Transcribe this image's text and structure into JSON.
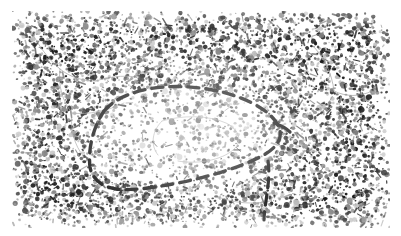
{
  "figure": {
    "domain": "natural-image",
    "kind": "histology-micrograph",
    "staining_appearance": "monochrome speckled nuclei on pale background",
    "orientation": "landscape",
    "plate": {
      "left": 12,
      "top": 11,
      "width": 378,
      "height": 217,
      "background_color": "#ffffff",
      "speckle_color": "#1a1a1a",
      "midtone_color": "#7a7a7a",
      "faint_color": "#b9b9b9"
    }
  },
  "cropped_header": {
    "visible": true,
    "note": "bottom few pixels of a text line cropped off above the figure",
    "ghost_text": "a p p e a r a n c e   o f   t h e   l e s i o n a l   t i s s u e   b o u n d a r y",
    "color": "#e2e2e2"
  },
  "annotations": {
    "dashed_outline": {
      "label": "dashed-region-outline",
      "style": "hand-drawn dashed line",
      "color": "#111111",
      "stroke_width": 3.4,
      "dash_pattern": "11 7",
      "encloses": "pale hypocellular region",
      "path": "M 92 100 C 104 86, 126 78, 152 76 C 182 74, 214 79, 240 92 C 256 100, 266 110, 268 120 C 270 130, 262 139, 248 146 C 226 157, 196 166, 166 172 C 140 177, 118 180, 104 178 C 90 176, 80 168, 78 156 C 76 140, 80 118, 92 100 Z"
    },
    "tail_stroke": {
      "label": "descending-tail-stroke",
      "style": "hand-drawn dashed line",
      "color": "#111111",
      "stroke_width": 3.2,
      "dash_pattern": "10 7",
      "path": "M 256 150 C 258 162, 256 176, 254 190 C 253 198, 252 204, 252 209"
    },
    "right_hook": {
      "label": "right-vertex-hook",
      "style": "hand-drawn short stroke",
      "color": "#111111",
      "stroke_width": 3.2,
      "path": "M 262 112 C 268 114, 274 117, 278 121"
    }
  },
  "tissue_features": {
    "vessels": {
      "label": "branching-vessel-outlines",
      "color": "#9a9a9a",
      "stroke_width": 0.8,
      "paths": [
        "M 18 18 C 26 34, 36 48, 48 58 C 58 66, 70 70, 84 70",
        "M 48 58 C 46 74, 50 90, 60 102",
        "M 60 102 C 76 104, 96 100, 112 92",
        "M 60 102 C 58 118, 62 134, 72 146",
        "M 84 70 C 96 66, 110 64, 124 66",
        "M 150 110 C 170 104, 196 104, 214 112 C 226 118, 230 128, 224 136 C 214 148, 188 154, 166 150",
        "M 150 110 C 140 120, 138 134, 146 144",
        "M 300 34 C 312 46, 320 62, 322 80",
        "M 322 80 C 334 86, 348 86, 360 80",
        "M 206 186 C 222 192, 242 194, 258 190"
      ]
    },
    "pale_region": {
      "label": "hypocellular-interior",
      "note": "interior of the dashed outline is visibly less densely speckled than surrounding tissue",
      "relative_density": 0.55
    },
    "dense_region": {
      "label": "hypercellular-surround",
      "note": "surrounding tissue is densely packed with dark nuclei",
      "relative_density": 1.0
    }
  },
  "noise": {
    "seed": 20240917,
    "speckle_count_dense": 6200,
    "speckle_count_sparse": 1500,
    "streak_count": 620
  }
}
